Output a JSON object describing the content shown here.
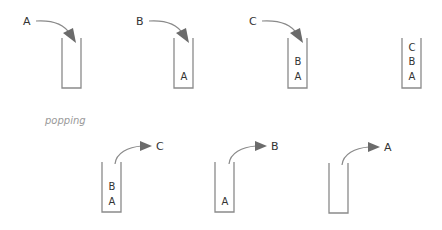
{
  "diagram": {
    "section_label": "popping",
    "push_steps": [
      {
        "incoming": "A",
        "contents_bottom_to_top": []
      },
      {
        "incoming": "B",
        "contents_bottom_to_top": [
          "A"
        ]
      },
      {
        "incoming": "C",
        "contents_bottom_to_top": [
          "A",
          "B"
        ]
      },
      {
        "incoming": null,
        "contents_bottom_to_top": [
          "A",
          "B",
          "C"
        ]
      }
    ],
    "pop_steps": [
      {
        "outgoing": "C",
        "contents_bottom_to_top": [
          "A",
          "B"
        ]
      },
      {
        "outgoing": "B",
        "contents_bottom_to_top": [
          "A"
        ]
      },
      {
        "outgoing": "A",
        "contents_bottom_to_top": []
      }
    ],
    "colors": {
      "stack_wall": "#8a8a8a",
      "arrow_line": "#8a8a8a",
      "arrow_head": "#6b6b6b",
      "text": "#333333",
      "caption": "#9a9a9a"
    }
  }
}
